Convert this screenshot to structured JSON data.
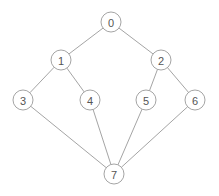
{
  "figure": {
    "type": "node-link-graph",
    "width": 219,
    "height": 196,
    "background_color": "#ffffff",
    "node_fill_color": "#ffffff",
    "node_stroke_color": "#9a9a9a",
    "edge_color": "#9a9a9a",
    "label_color": "#555555",
    "node_radius": 10,
    "directed": false
  },
  "chart_data": {
    "type": "graph",
    "title": "",
    "xlabel": "",
    "ylabel": "",
    "layout": "layered",
    "node_count": 8,
    "edge_count": 10,
    "nodes": [
      {
        "id": "0",
        "label": "0",
        "x": 111,
        "y": 22
      },
      {
        "id": "1",
        "label": "1",
        "x": 61,
        "y": 60
      },
      {
        "id": "2",
        "label": "2",
        "x": 161,
        "y": 60
      },
      {
        "id": "3",
        "label": "3",
        "x": 23,
        "y": 100
      },
      {
        "id": "4",
        "label": "4",
        "x": 90,
        "y": 100
      },
      {
        "id": "5",
        "label": "5",
        "x": 146,
        "y": 100
      },
      {
        "id": "6",
        "label": "6",
        "x": 195,
        "y": 100
      },
      {
        "id": "7",
        "label": "7",
        "x": 114,
        "y": 174
      }
    ],
    "edges": [
      {
        "source": "0",
        "target": "1"
      },
      {
        "source": "0",
        "target": "2"
      },
      {
        "source": "1",
        "target": "3"
      },
      {
        "source": "1",
        "target": "4"
      },
      {
        "source": "2",
        "target": "5"
      },
      {
        "source": "2",
        "target": "6"
      },
      {
        "source": "3",
        "target": "7"
      },
      {
        "source": "4",
        "target": "7"
      },
      {
        "source": "5",
        "target": "7"
      },
      {
        "source": "6",
        "target": "7"
      }
    ]
  }
}
